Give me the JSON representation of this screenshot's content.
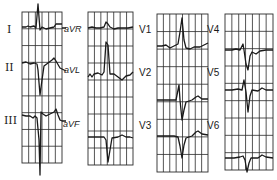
{
  "figure": {
    "type": "12-lead electrocardiogram",
    "background": "#ffffff",
    "ink_color": "#1a1a1a",
    "grid_color": "#2a2a2a"
  },
  "panels": [
    {
      "id": "limb-standard",
      "box": {
        "x": 22,
        "y": 12,
        "w": 40,
        "h": 151
      },
      "grid_cols": 6,
      "grid_rows": 9,
      "leads": [
        {
          "label": "I",
          "label_pos": {
            "x": 7,
            "y": 24
          },
          "baseline_y": 27,
          "trace": "M22,27 L26,27 L28,26 L30,27 L34,26 L36,28 L38,4 L40,30 L42,27 L46,29 L50,28 L54,27 L56,24 L60,24 L62,24"
        },
        {
          "label": "II",
          "label_pos": {
            "x": 5,
            "y": 62
          },
          "baseline_y": 63,
          "trace": "M22,63 L26,62 L30,64 L34,63 L37,64 L38,70 L40,95 L42,80 L44,66 L48,63 L52,60 L54,58 L56,61 L60,68 L62,69"
        },
        {
          "label": "III",
          "label_pos": {
            "x": 4,
            "y": 115
          },
          "baseline_y": 116,
          "trace": "M22,115 L26,116 L30,116 L33,118 L35,116 L37,118 L39,140 L40,175 L41,112 L43,114 L46,116 L50,114 L54,112 L56,109 L58,115 L60,120 L62,121"
        }
      ]
    },
    {
      "id": "limb-augmented",
      "box": {
        "x": 88,
        "y": 12,
        "w": 45,
        "h": 153
      },
      "grid_cols": 7,
      "grid_rows": 9,
      "leads": [
        {
          "label": "aVR",
          "label_pos": {
            "x": 64,
            "y": 25
          },
          "baseline_y": 28,
          "trace": "M62,28 L66,28 M88,28 L92,27 L96,28 L100,28 L104,27 L106,22 L108,24 L110,27 L114,29 L118,28 L124,28 L128,28 L133,27"
        },
        {
          "label": "aVL",
          "label_pos": {
            "x": 64,
            "y": 66
          },
          "baseline_y": 75,
          "trace": "M62,69 L66,71 M88,77 L90,74 L92,77 L94,74 L98,73 L102,75 L104,72 L106,42 L108,45 L110,74 L114,74 L118,77 L122,80 L126,76 L130,75 L133,72"
        },
        {
          "label": "aVF",
          "label_pos": {
            "x": 63,
            "y": 120
          },
          "baseline_y": 137,
          "trace": "M62,121 L66,121 M88,137 L94,137 L100,137 L104,137 L106,140 L108,162 L110,150 L112,138 L118,137 L122,135 L126,137 L130,137 L133,138"
        }
      ]
    },
    {
      "id": "precordial-1",
      "box": {
        "x": 157,
        "y": 14,
        "w": 51,
        "h": 158
      },
      "grid_cols": 8,
      "grid_rows": 9,
      "leads": [
        {
          "label": "V1",
          "label_pos": {
            "x": 139,
            "y": 25
          },
          "baseline_y": 46,
          "trace": "M157,46 L162,46 L166,45 L170,48 L174,46 L178,44 L180,32 L182,18 L184,40 L186,48 L190,49 L194,47 L200,47 L204,45 L208,43"
        },
        {
          "label": "V2",
          "label_pos": {
            "x": 139,
            "y": 68
          },
          "baseline_y": 100,
          "trace": "M157,100 L166,100 L172,100 L176,100 L178,90 L179,85 L180,100 L182,120 L184,110 L186,102 L192,100 L196,97 L198,96 L202,99 L208,99"
        },
        {
          "label": "V3",
          "label_pos": {
            "x": 139,
            "y": 121
          },
          "baseline_y": 136,
          "trace": "M157,136 L166,136 L174,136 L178,137 L180,146 L182,158 L184,145 L186,138 L192,136 L196,132 L198,131 L202,134 L208,135"
        }
      ]
    },
    {
      "id": "precordial-2",
      "box": {
        "x": 225,
        "y": 14,
        "w": 48,
        "h": 156
      },
      "grid_cols": 7,
      "grid_rows": 9,
      "leads": [
        {
          "label": "V4",
          "label_pos": {
            "x": 207,
            "y": 25
          },
          "baseline_y": 50,
          "trace": "M225,50 L232,50 L236,49 L240,50 L243,44 L244,50 L246,64 L248,70 L250,56 L252,52 L256,54 L260,51 L266,50 L273,50"
        },
        {
          "label": "V5",
          "label_pos": {
            "x": 207,
            "y": 68
          },
          "baseline_y": 90,
          "trace": "M225,90 L232,90 L238,89 L242,90 L244,80 L246,92 L248,112 L250,96 L252,90 L258,91 L262,88 L266,90 L273,90"
        },
        {
          "label": "V6",
          "label_pos": {
            "x": 207,
            "y": 121
          },
          "baseline_y": 158,
          "trace": "M225,158 L234,158 L240,157 L243,156 L245,160 L247,172 L249,163 L251,158 L258,158 L262,155 L266,157 L273,158"
        }
      ]
    }
  ]
}
